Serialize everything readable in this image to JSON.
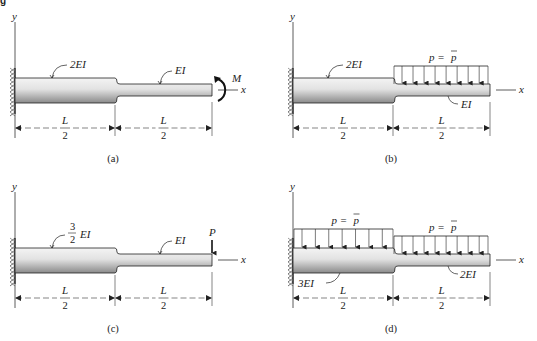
{
  "figure_header": "g",
  "axis_labels": {
    "y": "y",
    "x": "x"
  },
  "panels": [
    {
      "id": "a",
      "caption": "(a)",
      "segments": [
        {
          "stiffness": "2EI",
          "stiffness_parts": {
            "coef": "2",
            "suffix": "EI"
          },
          "length_num": "L",
          "length_den": "2"
        },
        {
          "stiffness": "EI",
          "stiffness_parts": {
            "coef": "",
            "suffix": "EI"
          },
          "length_num": "L",
          "length_den": "2"
        }
      ],
      "loads": [
        {
          "type": "moment",
          "label": "M",
          "location": "free end"
        }
      ]
    },
    {
      "id": "b",
      "caption": "(b)",
      "segments": [
        {
          "stiffness": "2EI",
          "stiffness_parts": {
            "coef": "2",
            "suffix": "EI"
          },
          "length_num": "L",
          "length_den": "2"
        },
        {
          "stiffness": "EI",
          "stiffness_parts": {
            "coef": "",
            "suffix": "EI"
          },
          "length_num": "L",
          "length_den": "2"
        }
      ],
      "loads": [
        {
          "type": "distributed",
          "label": "p = p̄",
          "label_lhs": "p =",
          "label_rhs": "p",
          "span": "right segment"
        }
      ]
    },
    {
      "id": "c",
      "caption": "(c)",
      "segments": [
        {
          "stiffness": "3/2 EI",
          "stiffness_parts": {
            "frac_num": "3",
            "frac_den": "2",
            "suffix": "EI"
          },
          "length_num": "L",
          "length_den": "2"
        },
        {
          "stiffness": "EI",
          "stiffness_parts": {
            "coef": "",
            "suffix": "EI"
          },
          "length_num": "L",
          "length_den": "2"
        }
      ],
      "loads": [
        {
          "type": "point",
          "label": "P",
          "location": "free end"
        }
      ]
    },
    {
      "id": "d",
      "caption": "(d)",
      "segments": [
        {
          "stiffness": "3EI",
          "stiffness_parts": {
            "coef": "3",
            "suffix": "EI"
          },
          "length_num": "L",
          "length_den": "2"
        },
        {
          "stiffness": "2EI",
          "stiffness_parts": {
            "coef": "2",
            "suffix": "EI"
          },
          "length_num": "L",
          "length_den": "2"
        }
      ],
      "loads": [
        {
          "type": "distributed",
          "label": "p = p̄",
          "label_lhs": "p =",
          "label_rhs": "p",
          "span": "left segment"
        },
        {
          "type": "distributed",
          "label": "p = p̄",
          "label_lhs": "p =",
          "label_rhs": "p",
          "span": "right segment"
        }
      ]
    }
  ]
}
